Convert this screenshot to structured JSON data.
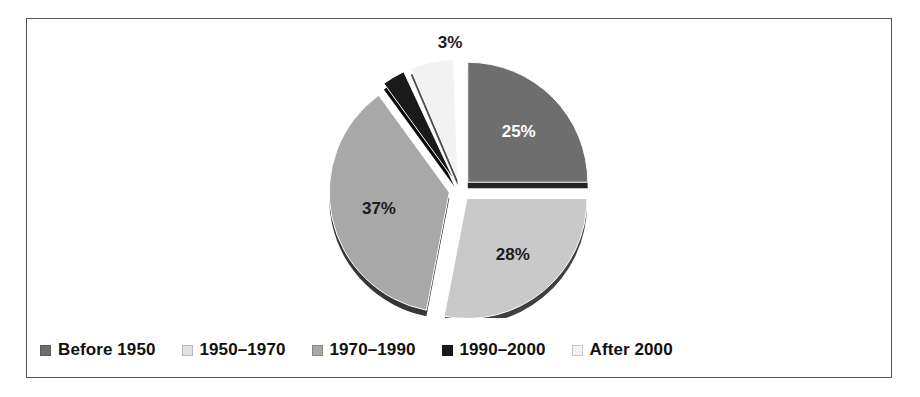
{
  "chart_data": {
    "type": "pie",
    "title": "",
    "subtitle": "",
    "xlabel": "",
    "ylabel": "",
    "legend_position": "bottom",
    "grid": false,
    "exploded": true,
    "style": "3d-shadow",
    "categories": [
      "Before 1950",
      "1950–1970",
      "1970–1990",
      "1990–2000",
      "After 2000"
    ],
    "values": [
      25,
      28,
      37,
      3,
      7
    ],
    "slices": [
      {
        "label": "Before 1950",
        "value": 25,
        "display": "25%",
        "color": "#6e6e6e",
        "label_color": "#ffffff",
        "label_placement": "inside",
        "start_angle": 0,
        "end_angle": 90
      },
      {
        "label": "1950–1970",
        "value": 28,
        "display": "28%",
        "color": "#c9c9c9",
        "label_color": "#1a1a1a",
        "label_placement": "inside",
        "start_angle": 90,
        "end_angle": 191
      },
      {
        "label": "1970–1990",
        "value": 37,
        "display": "37%",
        "color": "#a8a8a8",
        "label_color": "#1a1a1a",
        "label_placement": "inside",
        "start_angle": 191,
        "end_angle": 324
      },
      {
        "label": "1990–2000",
        "value": 3,
        "display": "",
        "color": "#1a1a1a",
        "label_color": "#1a1a1a",
        "label_placement": "none",
        "start_angle": 324,
        "end_angle": 335
      },
      {
        "label": "After 2000",
        "value": 7,
        "display": "3%",
        "color": "#f2f2f2",
        "label_color": "#1a1a1a",
        "label_placement": "outside-top",
        "start_angle": 337,
        "end_angle": 358
      }
    ],
    "external_labels": [
      {
        "text": "3%",
        "x": 424,
        "y": 30
      }
    ]
  },
  "legend": {
    "items": [
      {
        "label": "Before 1950",
        "color": "#6e6e6e"
      },
      {
        "label": "1950–1970",
        "color": "#e2e2e2"
      },
      {
        "label": "1970–1990",
        "color": "#a8a8a8"
      },
      {
        "label": "1990–2000",
        "color": "#1a1a1a"
      },
      {
        "label": "After 2000",
        "color": "#f2f2f2"
      }
    ]
  },
  "frame": {
    "border_color": "#555555",
    "background": "#ffffff"
  }
}
